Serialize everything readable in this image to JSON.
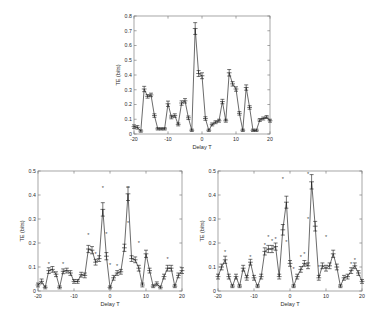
{
  "figure": {
    "background_color": "#ffffff",
    "line_color": "#1a1a1a",
    "axis_color": "#808080",
    "star_color": "#4a4a4a",
    "panel_count": 3
  },
  "chart_data": [
    {
      "panel": "top",
      "type": "line",
      "title": "",
      "xlabel": "Delay T",
      "ylabel": "TE (bits)",
      "xlim": [
        -20,
        20
      ],
      "ylim": [
        0,
        0.8
      ],
      "xticks": [
        -20,
        -10,
        0,
        10,
        20
      ],
      "xtick_labels": [
        "-20",
        "-10",
        "0",
        "10",
        "20"
      ],
      "yticks": [
        0,
        0.1,
        0.2,
        0.3,
        0.4,
        0.5,
        0.6,
        0.7,
        0.8
      ],
      "ytick_labels": [
        "0",
        "0.1",
        "0.2",
        "0.3",
        "0.4",
        "0.5",
        "0.6",
        "0.7",
        "0.8"
      ],
      "grid": false,
      "legend": null,
      "has_errorbars": true,
      "x": [
        -20,
        -19,
        -18,
        -17,
        -16,
        -15,
        -14,
        -13,
        -12,
        -11,
        -10,
        -9,
        -8,
        -7,
        -6,
        -5,
        -4,
        -3,
        -2,
        -1,
        0,
        1,
        2,
        3,
        4,
        5,
        6,
        7,
        8,
        9,
        10,
        11,
        12,
        13,
        14,
        15,
        16,
        17,
        18,
        19,
        20
      ],
      "values": [
        0.05,
        0.045,
        0.02,
        0.305,
        0.255,
        0.265,
        0.125,
        0.035,
        0.035,
        0.035,
        0.205,
        0.115,
        0.125,
        0.065,
        0.21,
        0.225,
        0.11,
        0.025,
        0.715,
        0.41,
        0.395,
        0.105,
        0.025,
        0.065,
        0.08,
        0.09,
        0.22,
        0.09,
        0.415,
        0.34,
        0.305,
        0.14,
        0.025,
        0.315,
        0.18,
        0.025,
        0.025,
        0.095,
        0.105,
        0.115,
        0.09,
        0.025,
        0.025,
        0.295,
        0.205
      ],
      "errors": [
        0.012,
        0.012,
        0.008,
        0.018,
        0.012,
        0.012,
        0.012,
        0.008,
        0.008,
        0.008,
        0.018,
        0.012,
        0.012,
        0.01,
        0.015,
        0.015,
        0.012,
        0.008,
        0.04,
        0.02,
        0.02,
        0.012,
        0.008,
        0.01,
        0.01,
        0.01,
        0.015,
        0.01,
        0.022,
        0.015,
        0.015,
        0.012,
        0.008,
        0.018,
        0.012,
        0.008,
        0.008,
        0.01,
        0.01,
        0.01,
        0.01,
        0.008,
        0.008,
        0.018,
        0.012
      ],
      "stars_x": [],
      "stars_y": []
    },
    {
      "panel": "bottom-left",
      "type": "line",
      "title": "",
      "xlabel": "Delay T",
      "ylabel": "TE (bits)",
      "xlim": [
        -20,
        20
      ],
      "ylim": [
        0,
        0.5
      ],
      "xticks": [
        -20,
        -10,
        0,
        10,
        20
      ],
      "xtick_labels": [
        "-20",
        "-10",
        "0",
        "10",
        "20"
      ],
      "yticks": [
        0,
        0.1,
        0.2,
        0.3,
        0.4,
        0.5
      ],
      "ytick_labels": [
        "0",
        "0.1",
        "0.2",
        "0.3",
        "0.4",
        "0.5"
      ],
      "grid": false,
      "legend": null,
      "has_errorbars": true,
      "x": [
        -20,
        -19,
        -18,
        -17,
        -16,
        -15,
        -14,
        -13,
        -12,
        -11,
        -10,
        -9,
        -8,
        -7,
        -6,
        -5,
        -4,
        -3,
        -2,
        -1,
        0,
        1,
        2,
        3,
        4,
        5,
        6,
        7,
        8,
        9,
        10,
        11,
        12,
        13,
        14,
        15,
        16,
        17,
        18,
        19,
        20
      ],
      "values": [
        0.025,
        0.04,
        0.015,
        0.085,
        0.09,
        0.07,
        0.015,
        0.082,
        0.085,
        0.075,
        0.04,
        0.04,
        0.068,
        0.065,
        0.175,
        0.17,
        0.12,
        0.135,
        0.34,
        0.145,
        0.015,
        0.055,
        0.075,
        0.08,
        0.18,
        0.405,
        0.135,
        0.13,
        0.095,
        0.025,
        0.155,
        0.085,
        0.02,
        0.03,
        0.015,
        0.06,
        0.095,
        0.095,
        0.02,
        0.065,
        0.085
      ],
      "errors": [
        0.008,
        0.01,
        0.006,
        0.012,
        0.012,
        0.01,
        0.006,
        0.01,
        0.01,
        0.01,
        0.008,
        0.008,
        0.01,
        0.01,
        0.015,
        0.015,
        0.012,
        0.012,
        0.028,
        0.015,
        0.006,
        0.01,
        0.01,
        0.01,
        0.015,
        0.028,
        0.012,
        0.012,
        0.012,
        0.008,
        0.015,
        0.01,
        0.006,
        0.008,
        0.006,
        0.01,
        0.012,
        0.012,
        0.006,
        0.01,
        0.012
      ],
      "stars_x": [
        -17,
        -13,
        -6,
        -4,
        -2,
        -1,
        0,
        2,
        5,
        5,
        8,
        16
      ],
      "stars_y": [
        0.105,
        0.105,
        0.225,
        0.145,
        0.42,
        0.23,
        0.1,
        0.095,
        0.42,
        0.275,
        0.19,
        0.125
      ]
    },
    {
      "panel": "bottom-right",
      "type": "line",
      "title": "",
      "xlabel": "Delay T",
      "ylabel": "TE (bits)",
      "xlim": [
        -20,
        20
      ],
      "ylim": [
        0,
        0.5
      ],
      "xticks": [
        -20,
        -10,
        0,
        10,
        20
      ],
      "xtick_labels": [
        "-20",
        "-10",
        "0",
        "10",
        "20"
      ],
      "yticks": [
        0,
        0.1,
        0.2,
        0.3,
        0.4,
        0.5
      ],
      "ytick_labels": [
        "0",
        "0.1",
        "0.2",
        "0.3",
        "0.4",
        "0.5"
      ],
      "grid": false,
      "legend": null,
      "has_errorbars": true,
      "x": [
        -20,
        -19,
        -18,
        -17,
        -16,
        -15,
        -14,
        -13,
        -12,
        -11,
        -10,
        -9,
        -8,
        -7,
        -6,
        -5,
        -4,
        -3,
        -2,
        -1,
        0,
        1,
        2,
        3,
        4,
        5,
        6,
        7,
        8,
        9,
        10,
        11,
        12,
        13,
        14,
        15,
        16,
        17,
        18,
        19,
        20
      ],
      "values": [
        0.06,
        0.1,
        0.13,
        0.06,
        0.02,
        0.06,
        0.02,
        0.095,
        0.055,
        0.12,
        0.055,
        0.02,
        0.06,
        0.165,
        0.175,
        0.175,
        0.185,
        0.06,
        0.255,
        0.37,
        0.115,
        0.02,
        0.06,
        0.09,
        0.115,
        0.105,
        0.455,
        0.27,
        0.055,
        0.105,
        0.095,
        0.105,
        0.155,
        0.1,
        0.02,
        0.055,
        0.06,
        0.085,
        0.105,
        0.075,
        0.04
      ],
      "errors": [
        0.01,
        0.012,
        0.015,
        0.01,
        0.006,
        0.01,
        0.006,
        0.012,
        0.01,
        0.012,
        0.01,
        0.006,
        0.01,
        0.015,
        0.015,
        0.015,
        0.015,
        0.01,
        0.022,
        0.025,
        0.012,
        0.006,
        0.01,
        0.012,
        0.012,
        0.012,
        0.03,
        0.02,
        0.01,
        0.012,
        0.012,
        0.012,
        0.015,
        0.012,
        0.006,
        0.01,
        0.01,
        0.012,
        0.012,
        0.01,
        0.008
      ],
      "stars_x": [
        -18,
        -11,
        -7,
        -6,
        -5,
        -4,
        -2,
        -1,
        1,
        3,
        4,
        5,
        5,
        8,
        10,
        17,
        18
      ],
      "stars_y": [
        0.155,
        0.135,
        0.185,
        0.215,
        0.2,
        0.21,
        0.46,
        0.195,
        0.085,
        0.135,
        0.145,
        0.48,
        0.29,
        0.09,
        0.215,
        0.105,
        0.12
      ]
    }
  ]
}
